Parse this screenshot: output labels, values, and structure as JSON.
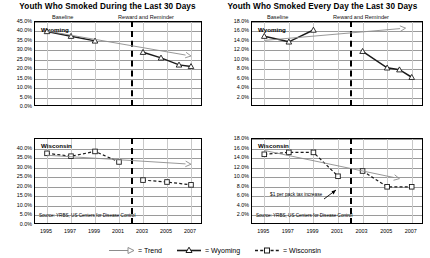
{
  "figure": {
    "legend": {
      "items": [
        {
          "name": "trend",
          "label": "= Trend"
        },
        {
          "name": "wyoming",
          "label": "= Wyoming"
        },
        {
          "name": "wisconsin",
          "label": "= Wisconsin"
        }
      ]
    }
  },
  "colors": {
    "wyoming": "#1a1a1a",
    "wisconsin": "#1a1a1a",
    "trend": "#8c8c8c",
    "grid": "#9a9a9a",
    "frame": "#000000",
    "divider": "#000000"
  },
  "chart_data": [
    {
      "id": "wyoming-past-30-days",
      "type": "line",
      "title": "Youth Who Smoked During the Last 30 Days",
      "series_name": "Wyoming",
      "xlabel": "",
      "ylabel": "",
      "xlim": [
        1994,
        2008
      ],
      "ylim": [
        0,
        45
      ],
      "grid": true,
      "legend_position": "figure-bottom",
      "phase_labels": [
        "Baseline",
        "Reward and Reminder"
      ],
      "phase_divider_x": 2002,
      "source": "Source: YRBS, US Centers for Disease Control",
      "ytick_labels": [
        "45.0%",
        "40.0%",
        "35.0%",
        "30.0%",
        "25.0%",
        "20.0%",
        "15.0%",
        "10.0%",
        "5.0%",
        "0.0%"
      ],
      "ytick_values": [
        45,
        40,
        35,
        30,
        25,
        20,
        15,
        10,
        5,
        0
      ],
      "xtick_labels": [
        "1995",
        "1997",
        "1999",
        "2001",
        "2003",
        "2005",
        "2007"
      ],
      "xtick_values": [
        1995,
        1997,
        1999,
        2001,
        2003,
        2005,
        2007
      ],
      "series": [
        {
          "name": "Wyoming baseline",
          "marker": "triangle",
          "style": "solid",
          "x": [
            1995,
            1997,
            1999
          ],
          "values": [
            40.0,
            37.5,
            35.0
          ]
        },
        {
          "name": "Wyoming reward and reminder",
          "marker": "triangle",
          "style": "solid",
          "x": [
            2003,
            2004.5,
            2006,
            2007
          ],
          "values": [
            29.0,
            26.0,
            22.3,
            21.5
          ]
        },
        {
          "name": "Trend",
          "marker": "arrow",
          "style": "solid-thin",
          "x": [
            1995,
            2007
          ],
          "values": [
            40.2,
            27.0
          ]
        }
      ]
    },
    {
      "id": "wyoming-every-day",
      "type": "line",
      "title": "Youth Who Smoked Every Day the Last 30 Days",
      "series_name": "Wyoming",
      "xlabel": "",
      "ylabel": "",
      "xlim": [
        1994,
        2008
      ],
      "ylim": [
        0,
        18
      ],
      "grid": true,
      "legend_position": "figure-bottom",
      "phase_labels": [
        "Baseline",
        "Reward and Reminder"
      ],
      "phase_divider_x": 2002,
      "source": "",
      "ytick_labels": [
        "18.0%",
        "16.0%",
        "14.0%",
        "12.0%",
        "10.0%",
        "8.0%",
        "6.0%",
        "4.0%",
        "2.0%"
      ],
      "ytick_values": [
        18,
        16,
        14,
        12,
        10,
        8,
        6,
        4,
        2
      ],
      "xtick_labels": [
        "1995",
        "1997",
        "1999",
        "2001",
        "2003",
        "2005",
        "2007"
      ],
      "xtick_values": [
        1995,
        1997,
        1999,
        2001,
        2003,
        2005,
        2007
      ],
      "series": [
        {
          "name": "Wyoming baseline",
          "marker": "triangle",
          "style": "solid",
          "x": [
            1995,
            1997,
            1999
          ],
          "values": [
            15.0,
            13.8,
            16.3
          ]
        },
        {
          "name": "Wyoming reward and reminder",
          "marker": "triangle",
          "style": "solid",
          "x": [
            2003,
            2005,
            2006,
            2007
          ],
          "values": [
            11.8,
            8.3,
            7.9,
            6.3
          ]
        },
        {
          "name": "Trend",
          "marker": "arrow",
          "style": "solid-thin",
          "x": [
            1995,
            2006.5
          ],
          "values": [
            14.1,
            16.7
          ]
        }
      ]
    },
    {
      "id": "wisconsin-past-30-days",
      "type": "line",
      "title": "",
      "series_name": "Wisconsin",
      "xlabel": "",
      "ylabel": "",
      "xlim": [
        1994,
        2008
      ],
      "ylim": [
        0,
        45
      ],
      "grid": true,
      "legend_position": "figure-bottom",
      "phase_divider_x": 2002,
      "source": "Source: YRBS, US Centers for Disease Control",
      "ytick_labels": [
        "40.0%",
        "35.0%",
        "30.0%",
        "25.0%",
        "20.0%",
        "15.0%",
        "10.0%",
        "5.0%",
        "0.0%"
      ],
      "ytick_values": [
        40,
        35,
        30,
        25,
        20,
        15,
        10,
        5,
        0
      ],
      "xtick_labels": [
        "1995",
        "1997",
        "1999",
        "2001",
        "2003",
        "2005",
        "2007"
      ],
      "xtick_values": [
        1995,
        1997,
        1999,
        2001,
        2003,
        2005,
        2007
      ],
      "series": [
        {
          "name": "Wisconsin baseline",
          "marker": "square",
          "style": "dashed",
          "x": [
            1995,
            1997,
            1999,
            2001
          ],
          "values": [
            37.5,
            36.0,
            38.5,
            33.0
          ]
        },
        {
          "name": "Wisconsin post",
          "marker": "square",
          "style": "dashed",
          "x": [
            2003,
            2005,
            2007
          ],
          "values": [
            23.5,
            22.5,
            21.0
          ]
        },
        {
          "name": "Trend",
          "marker": "arrow",
          "style": "solid-thin",
          "x": [
            1995,
            2007
          ],
          "values": [
            36.5,
            31.8
          ]
        }
      ]
    },
    {
      "id": "wisconsin-every-day",
      "type": "line",
      "title": "",
      "series_name": "Wisconsin",
      "xlabel": "",
      "ylabel": "",
      "xlim": [
        1994,
        2008
      ],
      "ylim": [
        0,
        18
      ],
      "grid": true,
      "legend_position": "figure-bottom",
      "phase_divider_x": 2002,
      "source": "Source: YRBS, US Centers for Disease Control",
      "annotation": "$1 per pack tax increase",
      "ytick_labels": [
        "18.0%",
        "16.0%",
        "14.0%",
        "12.0%",
        "10.0%",
        "8.0%",
        "6.0%",
        "4.0%",
        "2.0%"
      ],
      "ytick_values": [
        18,
        16,
        14,
        12,
        10,
        8,
        6,
        4,
        2
      ],
      "xtick_labels": [
        "1995",
        "1997",
        "1999",
        "2001",
        "2003",
        "2005",
        "2007"
      ],
      "xtick_values": [
        1995,
        1997,
        1999,
        2001,
        2003,
        2005,
        2007
      ],
      "series": [
        {
          "name": "Wisconsin baseline",
          "marker": "square",
          "style": "dashed",
          "x": [
            1995,
            1997,
            1999,
            2001
          ],
          "values": [
            14.8,
            15.2,
            15.2,
            10.2
          ]
        },
        {
          "name": "Wisconsin post",
          "marker": "square",
          "style": "dashed",
          "x": [
            2003,
            2005,
            2007
          ],
          "values": [
            11.3,
            8.0,
            8.0
          ]
        },
        {
          "name": "Trend",
          "marker": "arrow",
          "style": "solid-thin",
          "x": [
            1995,
            2006
          ],
          "values": [
            15.6,
            9.7
          ]
        }
      ]
    }
  ]
}
